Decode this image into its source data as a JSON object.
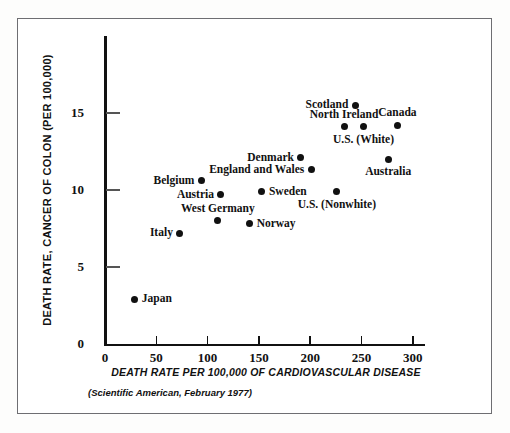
{
  "chart_data": {
    "type": "scatter",
    "title": "",
    "xlabel": "DEATH RATE PER 100,000 OF CARDIOVASCULAR DISEASE",
    "ylabel": "DEATH RATE, CANCER OF COLON (PER 100,000)",
    "source": "(Scientific American, February 1977)",
    "xlim": [
      0,
      312
    ],
    "ylim": [
      0,
      20.3
    ],
    "xticks": [
      0,
      50,
      100,
      150,
      200,
      250,
      300
    ],
    "xticklabels": [
      "0",
      "50",
      "100",
      "150",
      "200",
      "250",
      "300"
    ],
    "yticks": [
      0,
      5,
      10,
      15
    ],
    "yticklabels": [
      "0",
      "5",
      "10",
      "15"
    ],
    "grid": false,
    "legend": false,
    "marker_color": "#111111",
    "axis_color": "#111111",
    "points": [
      {
        "label": "Japan",
        "x": 29,
        "y": 2.9,
        "label_pos": "right"
      },
      {
        "label": "Italy",
        "x": 73,
        "y": 7.2,
        "label_pos": "left"
      },
      {
        "label": "West Germany",
        "x": 110,
        "y": 8.0,
        "label_pos": "above"
      },
      {
        "label": "Austria",
        "x": 113,
        "y": 9.7,
        "label_pos": "left"
      },
      {
        "label": "Belgium",
        "x": 94,
        "y": 10.6,
        "label_pos": "left"
      },
      {
        "label": "Norway",
        "x": 141,
        "y": 7.8,
        "label_pos": "right"
      },
      {
        "label": "Sweden",
        "x": 153,
        "y": 9.9,
        "label_pos": "right"
      },
      {
        "label": "England and Wales",
        "x": 201,
        "y": 11.3,
        "label_pos": "left"
      },
      {
        "label": "Denmark",
        "x": 191,
        "y": 12.1,
        "label_pos": "left"
      },
      {
        "label": "U.S. (Nonwhite)",
        "x": 226,
        "y": 9.9,
        "label_pos": "below"
      },
      {
        "label": "North Ireland",
        "x": 233,
        "y": 14.1,
        "label_pos": "above"
      },
      {
        "label": "U.S. (White)",
        "x": 252,
        "y": 14.1,
        "label_pos": "below"
      },
      {
        "label": "Scotland",
        "x": 244,
        "y": 15.5,
        "label_pos": "left"
      },
      {
        "label": "Canada",
        "x": 285,
        "y": 14.2,
        "label_pos": "above"
      },
      {
        "label": "Australia",
        "x": 276,
        "y": 12.0,
        "label_pos": "below"
      }
    ]
  }
}
